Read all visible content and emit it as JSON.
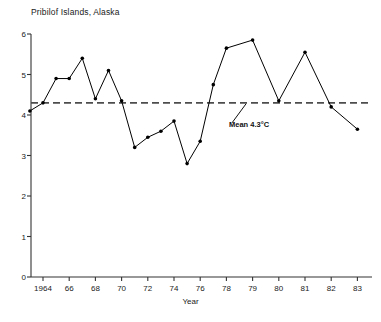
{
  "chart_data": {
    "type": "line",
    "title": "Pribilof Islands, Alaska",
    "xlabel": "Year",
    "ylabel": "",
    "xlim": [
      1963,
      1983
    ],
    "ylim": [
      0,
      6
    ],
    "grid": false,
    "legend": null,
    "x_tick_labels": [
      "1964",
      "66",
      "68",
      "70",
      "72",
      "74",
      "76",
      "78",
      "79",
      "80",
      "81",
      "82",
      "83"
    ],
    "x_tick_values": [
      1964,
      1966,
      1968,
      1970,
      1972,
      1974,
      1976,
      1978,
      1979,
      1980,
      1981,
      1982,
      1983
    ],
    "y_tick_labels": [
      "0",
      "1",
      "2",
      "3",
      "4",
      "5",
      "6"
    ],
    "y_tick_values": [
      0,
      1,
      2,
      3,
      4,
      5,
      6
    ],
    "series": [
      {
        "name": "Annual mean temperature",
        "marker": "filled-circle",
        "color": "#000000",
        "x": [
          1963,
          1964,
          1965,
          1966,
          1967,
          1968,
          1969,
          1970,
          1971,
          1972,
          1973,
          1974,
          1975,
          1976,
          1977,
          1978,
          1979,
          1980,
          1981,
          1982,
          1983
        ],
        "values": [
          4.1,
          4.3,
          4.9,
          4.9,
          5.4,
          4.4,
          5.1,
          4.35,
          3.2,
          3.45,
          3.6,
          3.85,
          2.8,
          3.35,
          4.75,
          5.65,
          5.85,
          4.35,
          5.55,
          4.2,
          3.65
        ]
      }
    ],
    "annotations": [
      {
        "name": "mean-line",
        "type": "hline",
        "value": 4.3,
        "style": "dashed",
        "label": "Mean 4.3°C"
      }
    ]
  },
  "labels": {
    "title": "Pribilof Islands, Alaska",
    "xlabel": "Year",
    "mean_annotation": "Mean 4.3°C"
  },
  "colors": {
    "line": "#000000",
    "marker": "#000000",
    "mean_line": "#4d4d4d",
    "axis": "#333333",
    "text": "#1a1a1a",
    "background": "#ffffff"
  }
}
